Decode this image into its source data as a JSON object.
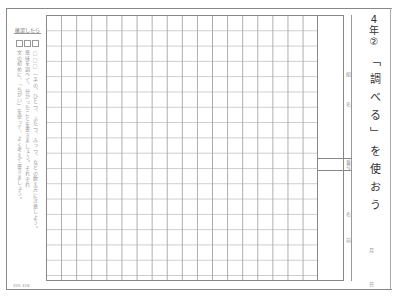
{
  "worksheet": {
    "grade": "4",
    "grade_unit": "年",
    "number": "②",
    "title": "「調べる」を使おう",
    "code": "420 418"
  },
  "instructions": {
    "title": "確認したら",
    "columns": [
      "□□□ 一字の、ひとつ、ふたつ、みっつ、などの数え方に注意しよう。",
      "意味を調べて、分かったことを書きましょう。それぞれ",
      "文の初めに、「ちがい」を使って、よく考えて書きましょう。"
    ]
  },
  "grid": {
    "columns": 18,
    "rows": 17
  },
  "name_panel": {
    "class_label_1": "組",
    "class_label_2": "名",
    "number_label": "番号",
    "name_label_1": "名",
    "name_label_2": "前"
  },
  "date": {
    "month_label": "月",
    "day_label": "日"
  }
}
